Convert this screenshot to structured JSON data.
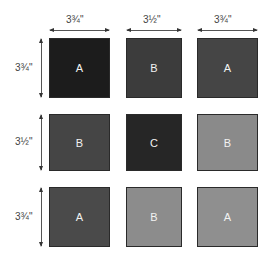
{
  "columns": [
    {
      "label": "3¾\"",
      "x": 49,
      "w": 61
    },
    {
      "label": "3½\"",
      "x": 126,
      "w": 56
    },
    {
      "label": "3¾\"",
      "x": 197,
      "w": 61
    }
  ],
  "rows": [
    {
      "label": "3¾\"",
      "y": 38,
      "h": 60
    },
    {
      "label": "3½\"",
      "y": 114,
      "h": 57
    },
    {
      "label": "3¾\"",
      "y": 187,
      "h": 60
    }
  ],
  "blocks": [
    [
      {
        "letter": "A",
        "color": "#1c1c1c"
      },
      {
        "letter": "B",
        "color": "#3c3c3c"
      },
      {
        "letter": "A",
        "color": "#454545"
      }
    ],
    [
      {
        "letter": "B",
        "color": "#454545"
      },
      {
        "letter": "C",
        "color": "#262626"
      },
      {
        "letter": "B",
        "color": "#8a8a8a"
      }
    ],
    [
      {
        "letter": "A",
        "color": "#4a4a4a"
      },
      {
        "letter": "B",
        "color": "#8c8c8c"
      },
      {
        "letter": "A",
        "color": "#8f8f8f"
      }
    ]
  ]
}
